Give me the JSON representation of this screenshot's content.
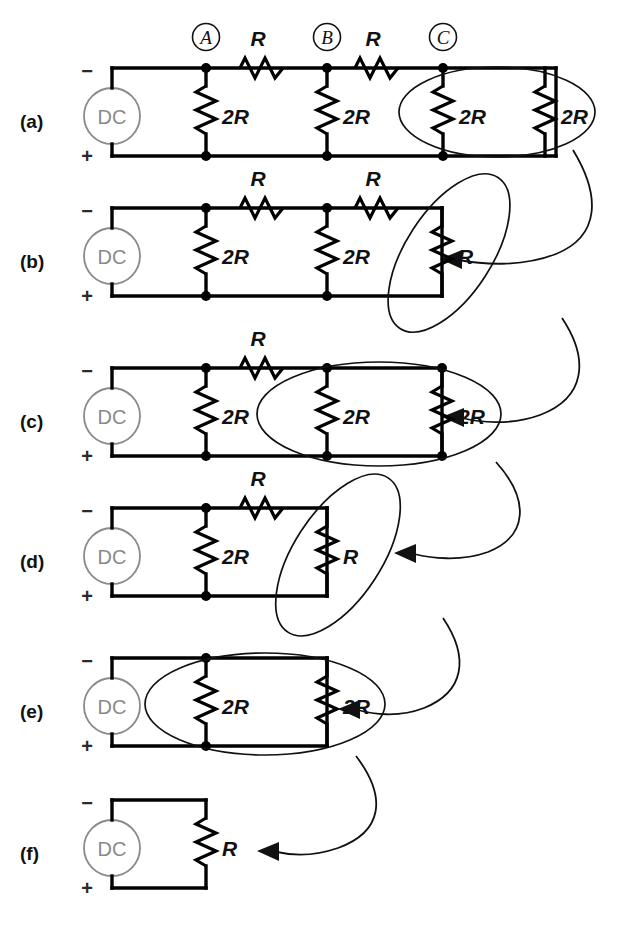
{
  "figure": {
    "background_color": "#ffffff",
    "wire_color": "#000000",
    "source_color": "#8a8a8a",
    "annotation_color": "#111111",
    "source_label": "DC",
    "terminal_negative": "−",
    "terminal_positive": "+",
    "node_labels": [
      "A",
      "B",
      "C"
    ],
    "panels": [
      {
        "id": "a",
        "label": "(a)",
        "series_resistors": [
          "R",
          "R"
        ],
        "shunt_resistors": [
          "2R",
          "2R",
          "2R",
          "2R"
        ],
        "node_markers": [
          "A",
          "B",
          "C"
        ],
        "annotation": {
          "highlight": "two parallel 2R resistors at node C",
          "ellipse_orientation": "horizontal",
          "arrow_to_panel": "b"
        }
      },
      {
        "id": "b",
        "label": "(b)",
        "series_resistors": [
          "R",
          "R"
        ],
        "shunt_resistors": [
          "2R",
          "2R",
          "R"
        ],
        "node_markers": [],
        "annotation": {
          "highlight": "series R plus shunt R reduced branch",
          "ellipse_orientation": "tilted",
          "arrow_to_panel": "c"
        }
      },
      {
        "id": "c",
        "label": "(c)",
        "series_resistors": [
          "R"
        ],
        "shunt_resistors": [
          "2R",
          "2R",
          "2R"
        ],
        "node_markers": [],
        "annotation": {
          "highlight": "two parallel 2R resistors",
          "ellipse_orientation": "horizontal",
          "arrow_to_panel": "d"
        }
      },
      {
        "id": "d",
        "label": "(d)",
        "series_resistors": [
          "R"
        ],
        "shunt_resistors": [
          "2R",
          "R"
        ],
        "node_markers": [],
        "annotation": {
          "highlight": "series R plus shunt R reduced branch",
          "ellipse_orientation": "tilted",
          "arrow_to_panel": "e"
        }
      },
      {
        "id": "e",
        "label": "(e)",
        "series_resistors": [],
        "shunt_resistors": [
          "2R",
          "2R"
        ],
        "node_markers": [],
        "annotation": {
          "highlight": "two parallel 2R resistors",
          "ellipse_orientation": "horizontal",
          "arrow_to_panel": "f"
        }
      },
      {
        "id": "f",
        "label": "(f)",
        "series_resistors": [],
        "shunt_resistors": [
          "R"
        ],
        "node_markers": [],
        "annotation": {
          "highlight": "final equivalent resistance R",
          "ellipse_orientation": "none",
          "arrow_to_panel": null
        }
      }
    ]
  }
}
